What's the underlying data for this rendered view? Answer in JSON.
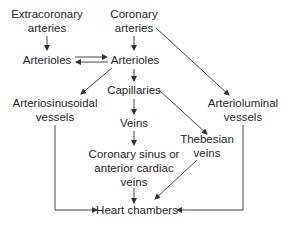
{
  "colors": {
    "text": "#262626",
    "line": "#333333",
    "background": "#ffffff"
  },
  "nodes": {
    "extracoronary_arteries": {
      "lines": [
        "Extracoronary",
        "arteries"
      ]
    },
    "coronary_arteries": {
      "lines": [
        "Coronary",
        "arteries"
      ]
    },
    "arterioles_left": {
      "lines": [
        "Arterioles"
      ]
    },
    "arterioles_right": {
      "lines": [
        "Arterioles"
      ]
    },
    "capillaries": {
      "lines": [
        "Capillaries"
      ]
    },
    "arteriosinusoidal_vessels": {
      "lines": [
        "Arteriosinusoidal",
        "vessels"
      ]
    },
    "arterioluminal_vessels": {
      "lines": [
        "Arterioluminal",
        "vessels"
      ]
    },
    "veins": {
      "lines": [
        "Veins"
      ]
    },
    "thebesian_veins": {
      "lines": [
        "Thebesian",
        "veins"
      ]
    },
    "coronary_sinus": {
      "lines": [
        "Coronary sinus or",
        "anterior cardiac",
        "veins"
      ]
    },
    "heart_chambers": {
      "lines": [
        "Heart chambers"
      ]
    }
  },
  "edges": [
    {
      "from": "Extracoronary arteries",
      "to": "Arterioles (left)"
    },
    {
      "from": "Coronary arteries",
      "to": "Arterioles (right)"
    },
    {
      "from": "Coronary arteries",
      "to": "Arterioluminal vessels"
    },
    {
      "from": "Arterioles (left)",
      "to": "Arterioles (right)"
    },
    {
      "from": "Arterioles (right)",
      "to": "Arterioles (left)"
    },
    {
      "from": "Arterioles (right)",
      "to": "Arteriosinusoidal vessels"
    },
    {
      "from": "Arterioles (right)",
      "to": "Capillaries"
    },
    {
      "from": "Capillaries",
      "to": "Veins"
    },
    {
      "from": "Capillaries",
      "to": "Thebesian veins"
    },
    {
      "from": "Veins",
      "to": "Coronary sinus or anterior cardiac veins"
    },
    {
      "from": "Coronary sinus or anterior cardiac veins",
      "to": "Heart chambers"
    },
    {
      "from": "Thebesian veins",
      "to": "Heart chambers"
    },
    {
      "from": "Arteriosinusoidal vessels",
      "to": "Heart chambers"
    },
    {
      "from": "Arterioluminal vessels",
      "to": "Heart chambers"
    }
  ]
}
